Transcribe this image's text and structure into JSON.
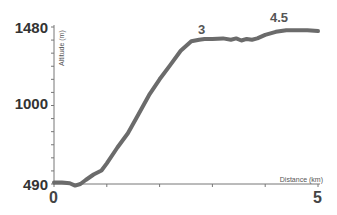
{
  "chart_data": {
    "type": "line",
    "title": "",
    "xlabel": "Distance (km)",
    "ylabel": "Altitude (m)",
    "xlim": [
      0,
      5
    ],
    "ylim": [
      490,
      1480
    ],
    "x_tick_labels": [
      "0",
      "5"
    ],
    "y_tick_labels": [
      "490",
      "1000",
      "1480"
    ],
    "grid": false,
    "legend": null,
    "line_color": "#6b6b6b",
    "annotations": [
      {
        "text": "3",
        "x": 3.0,
        "y": 1480
      },
      {
        "text": "4.5",
        "x": 4.5,
        "y": 1480
      }
    ],
    "series": [
      {
        "name": "Altitude profile",
        "x": [
          0,
          0.15,
          0.3,
          0.4,
          0.5,
          0.6,
          0.75,
          0.9,
          1.0,
          1.2,
          1.4,
          1.6,
          1.8,
          2.0,
          2.2,
          2.4,
          2.6,
          2.75,
          2.85,
          3.0,
          3.2,
          3.35,
          3.45,
          3.55,
          3.65,
          3.75,
          3.85,
          4.0,
          4.2,
          4.4,
          4.6,
          4.8,
          5.0
        ],
        "values": [
          500,
          500,
          495,
          480,
          490,
          515,
          550,
          575,
          620,
          720,
          810,
          930,
          1050,
          1150,
          1240,
          1330,
          1390,
          1400,
          1405,
          1405,
          1408,
          1400,
          1408,
          1395,
          1405,
          1400,
          1408,
          1430,
          1450,
          1460,
          1460,
          1460,
          1455
        ]
      }
    ]
  }
}
